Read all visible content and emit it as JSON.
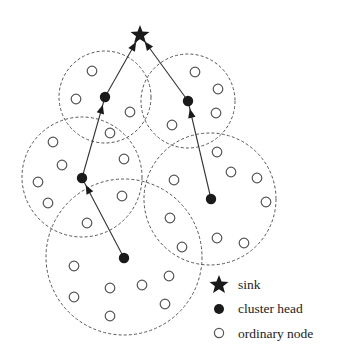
{
  "diagram": {
    "type": "clustered wireless sensor network",
    "colors": {
      "background": "#ffffff",
      "stroke": "#333333",
      "dashed_circle": "#555555",
      "cluster_head": "#1a1a1a",
      "ordinary_node_stroke": "#555555"
    },
    "sink": {
      "x": 140,
      "y": 35
    },
    "clusters": [
      {
        "id": "top-left",
        "cx": 105,
        "cy": 97,
        "r": 46,
        "head": {
          "x": 105,
          "y": 97
        }
      },
      {
        "id": "top-right",
        "cx": 188,
        "cy": 101,
        "r": 47,
        "head": {
          "x": 188,
          "y": 101
        }
      },
      {
        "id": "middle-left",
        "cx": 82,
        "cy": 177,
        "r": 60,
        "head": {
          "x": 82,
          "y": 178
        }
      },
      {
        "id": "middle-right",
        "cx": 210,
        "cy": 199,
        "r": 66,
        "head": {
          "x": 211,
          "y": 199
        }
      },
      {
        "id": "bottom",
        "cx": 124,
        "cy": 257,
        "r": 78,
        "head": {
          "x": 124,
          "y": 258
        }
      }
    ],
    "ordinary_nodes": [
      [
        92,
        71
      ],
      [
        76,
        99
      ],
      [
        130,
        112
      ],
      [
        110,
        133
      ],
      [
        195,
        72
      ],
      [
        218,
        89
      ],
      [
        216,
        113
      ],
      [
        172,
        125
      ],
      [
        53,
        142
      ],
      [
        62,
        165
      ],
      [
        38,
        182
      ],
      [
        48,
        203
      ],
      [
        124,
        159
      ],
      [
        122,
        196
      ],
      [
        87,
        223
      ],
      [
        217,
        152
      ],
      [
        231,
        172
      ],
      [
        257,
        178
      ],
      [
        174,
        180
      ],
      [
        266,
        202
      ],
      [
        170,
        218
      ],
      [
        217,
        238
      ],
      [
        244,
        243
      ],
      [
        182,
        247
      ],
      [
        74,
        266
      ],
      [
        110,
        288
      ],
      [
        142,
        285
      ],
      [
        169,
        276
      ],
      [
        74,
        297
      ],
      [
        165,
        304
      ],
      [
        110,
        316
      ]
    ],
    "arrows": [
      {
        "from": [
          124,
          258
        ],
        "to": [
          82,
          178
        ]
      },
      {
        "from": [
          82,
          178
        ],
        "to": [
          105,
          97
        ]
      },
      {
        "from": [
          105,
          97
        ],
        "to": [
          140,
          35
        ]
      },
      {
        "from": [
          211,
          199
        ],
        "to": [
          188,
          101
        ]
      },
      {
        "from": [
          188,
          101
        ],
        "to": [
          140,
          35
        ]
      }
    ]
  },
  "legend": {
    "items": [
      {
        "icon": "star-icon",
        "label": "sink"
      },
      {
        "icon": "filled-circle-icon",
        "label": "cluster head"
      },
      {
        "icon": "hollow-circle-icon",
        "label": "ordinary node"
      }
    ]
  }
}
